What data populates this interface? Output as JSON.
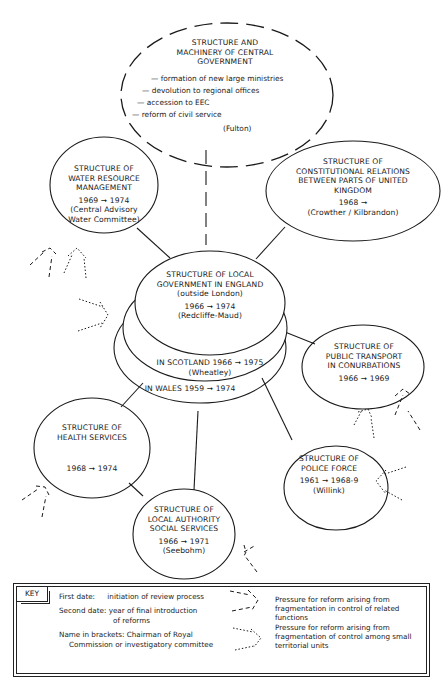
{
  "central": {
    "title_lines": [
      "STRUCTURE AND",
      "MACHINERY OF CENTRAL",
      "GOVERNMENT"
    ],
    "bullets": [
      "— formation of new large ministries",
      "— devolution to regional offices",
      "— accession to EEC",
      "— reform of civil service"
    ],
    "name": "(Fulton)"
  },
  "nodes": {
    "water": {
      "title_lines": [
        "STRUCTURE OF",
        "WATER RESOURCE",
        "MANAGEMENT"
      ],
      "dates": "1969 ➞ 1974",
      "name_lines": [
        "(Central Advisory",
        "Water Committee)"
      ]
    },
    "constitutional": {
      "title_lines": [
        "STRUCTURE OF",
        "CONSTITUTIONAL RELATIONS",
        "BETWEEN PARTS OF UNITED",
        "KINGDOM"
      ],
      "dates": "1968 ➞",
      "name_lines": [
        "(Crowther / Kilbrandon)"
      ]
    },
    "local_gov": {
      "title_lines": [
        "STRUCTURE OF LOCAL",
        "GOVERNMENT IN ENGLAND"
      ],
      "subtitle": "(outside London)",
      "dates": "1966 ➞ 1974",
      "name_lines": [
        "(Redcliffe-Maud)"
      ],
      "scotland": "IN SCOTLAND 1966 ➞ 1975",
      "scotland_name": "(Wheatley)",
      "wales": "IN WALES 1959 ➞ 1974"
    },
    "transport": {
      "title_lines": [
        "STRUCTURE OF",
        "PUBLIC TRANSPORT",
        "IN CONURBATIONS"
      ],
      "dates": "1966 ➞ 1969"
    },
    "health": {
      "title_lines": [
        "STRUCTURE OF",
        "HEALTH SERVICES"
      ],
      "dates": "1968 ➞ 1974"
    },
    "police": {
      "title_lines": [
        "STRUCTURE OF",
        "POLICE FORCE"
      ],
      "dates": "1961 ➞ 1968-9",
      "name_lines": [
        "(Willink)"
      ]
    },
    "social": {
      "title_lines": [
        "STRUCTURE OF",
        "LOCAL AUTHORITY",
        "SOCIAL SERVICES"
      ],
      "dates": "1966 ➞ 1971",
      "name_lines": [
        "(Seebohm)"
      ]
    }
  },
  "key": {
    "label": "KEY",
    "first_date_label": "First date:",
    "first_date_text": "initiation of review process",
    "second_date_label": "Second date:",
    "second_date_text_lines": [
      "year of final introduction",
      "of reforms"
    ],
    "name_text_lines": [
      "Name in brackets: Chairman of Royal",
      "Commission or investigatory committee"
    ],
    "legend": [
      {
        "style": "dashed",
        "text": "Pressure for reform arising from fragmentation in control of related functions"
      },
      {
        "style": "dotted",
        "text": "Pressure for reform arising from fragmentation of control among small territorial units"
      }
    ]
  }
}
